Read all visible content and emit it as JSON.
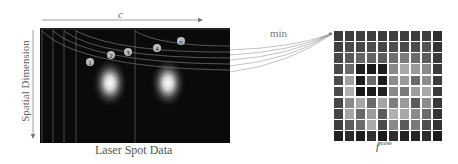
{
  "labels": {
    "time_axis": "c",
    "spatial_axis": "Spatial Dimension",
    "laser_caption": "Laser Spot Data",
    "operation": "min",
    "output_name": "f",
    "output_superscript": "noise"
  },
  "markers": [
    "1",
    "2",
    "3",
    "4",
    "n"
  ],
  "noise_grid": {
    "rows": 10,
    "cols": 10,
    "shades": [
      [
        "#3a3a3a",
        "#3d3d3d",
        "#3f3f3f",
        "#3e3e3e",
        "#3c3c3c",
        "#404040",
        "#3f3f3f",
        "#3d3d3d",
        "#3e3e3e",
        "#2e2e2e"
      ],
      [
        "#404040",
        "#4a4a4a",
        "#484848",
        "#4c4c4c",
        "#464646",
        "#4e4e4e",
        "#4a4a4a",
        "#4c4c4c",
        "#555555",
        "#333333"
      ],
      [
        "#484848",
        "#5a5a5a",
        "#666666",
        "#626262",
        "#5c5c5c",
        "#6e6e6e",
        "#7a7a7a",
        "#6a6a6a",
        "#5c5c5c",
        "#3a3a3a"
      ],
      [
        "#4a4a4a",
        "#6c6c6c",
        "#202020",
        "#1a1a1a",
        "#1e1e1e",
        "#8a8a8a",
        "#a8a8a8",
        "#9a9a9a",
        "#8a8a8a",
        "#3c3c3c"
      ],
      [
        "#4c4c4c",
        "#a0a0a0",
        "#1c1c1c",
        "#6a6a6a",
        "#1e1e1e",
        "#8c8c8c",
        "#9a9a9a",
        "#6a6a6a",
        "#8e8e8e",
        "#3c3c3c"
      ],
      [
        "#4a4a4a",
        "#b0b0b0",
        "#181818",
        "#1c1c1c",
        "#222222",
        "#8a8a8a",
        "#7a7a7a",
        "#9c9c9c",
        "#a8a8a8",
        "#3a3a3a"
      ],
      [
        "#464646",
        "#8a8a8a",
        "#a8a8a8",
        "#6a6a6a",
        "#a4a4a4",
        "#7e7e7e",
        "#9a9a9a",
        "#5a5a5a",
        "#8c8c8c",
        "#383838"
      ],
      [
        "#444444",
        "#a4a4a4",
        "#6a6a6a",
        "#9a9a9a",
        "#5c5c5c",
        "#b0b0b0",
        "#a8a8a8",
        "#8a8a8a",
        "#6a6a6a",
        "#363636"
      ],
      [
        "#3e3e3e",
        "#5c5c5c",
        "#6a6a6a",
        "#aaaaaa",
        "#4c4c4c",
        "#8a8a8a",
        "#5a5a5a",
        "#7a7a7a",
        "#4e4e4e",
        "#343434"
      ],
      [
        "#202020",
        "#2a2a2a",
        "#1e1e1e",
        "#303030",
        "#1c1c1c",
        "#2e2e2e",
        "#222222",
        "#262626",
        "#2c2c2c",
        "#1c1c1c"
      ]
    ]
  }
}
